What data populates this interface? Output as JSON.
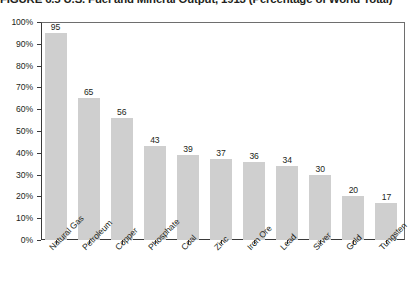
{
  "figure": {
    "number": "FIGURE 6.5",
    "title": "U.S. Fuel and Mineral Output, 1913 (Percentage of World Total)",
    "full_title": "FIGURE 6.5  U.S. Fuel and Mineral Output, 1913 (Percentage of World Total)"
  },
  "colors": {
    "bar_fill": "#cfcfcf",
    "axis": "#3a3a3a",
    "frame": "#6e6e6e",
    "text": "#231f20",
    "background": "#ffffff"
  },
  "chart_data": {
    "type": "bar",
    "title": "FIGURE 6.5  U.S. Fuel and Mineral Output, 1913 (Percentage of World Total)",
    "xlabel": "",
    "ylabel": "",
    "ylim": [
      0,
      100
    ],
    "yticks": [
      0,
      10,
      20,
      30,
      40,
      50,
      60,
      70,
      80,
      90,
      100
    ],
    "ytick_labels": [
      "0%",
      "10%",
      "20%",
      "30%",
      "40%",
      "50%",
      "60%",
      "70%",
      "80%",
      "90%",
      "100%"
    ],
    "grid": false,
    "legend": false,
    "categories": [
      "Natural Gas",
      "Petroleum",
      "Copper",
      "Phosphate",
      "Coal",
      "Zinc",
      "Iron Ore",
      "Lead",
      "Silver",
      "Gold",
      "Tungsten"
    ],
    "values": [
      95,
      65,
      56,
      43,
      39,
      37,
      36,
      34,
      30,
      20,
      17
    ],
    "data_labels": [
      "95",
      "65",
      "56",
      "43",
      "39",
      "37",
      "36",
      "34",
      "30",
      "20",
      "17"
    ]
  }
}
